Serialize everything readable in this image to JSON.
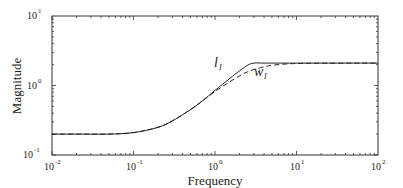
{
  "chart_data": {
    "type": "line",
    "title": "",
    "xlabel": "Frequency",
    "ylabel": "Magnitude",
    "xscale": "log",
    "yscale": "log",
    "xlim": [
      0.01,
      100
    ],
    "ylim": [
      0.1,
      10
    ],
    "grid": false,
    "legend": "none (inline annotations)",
    "x_ticks": [
      {
        "base": "10",
        "exp": "-2"
      },
      {
        "base": "10",
        "exp": "-1"
      },
      {
        "base": "10",
        "exp": "0"
      },
      {
        "base": "10",
        "exp": "1"
      },
      {
        "base": "10",
        "exp": "2"
      }
    ],
    "y_ticks": [
      {
        "base": "10",
        "exp": "-1"
      },
      {
        "base": "10",
        "exp": "0"
      },
      {
        "base": "10",
        "exp": "1"
      }
    ],
    "x": [
      0.01,
      0.02,
      0.05,
      0.1,
      0.2,
      0.3,
      0.5,
      0.7,
      1.0,
      1.5,
      2.0,
      2.5,
      3.0,
      4.0,
      5.0,
      7.0,
      10,
      20,
      50,
      100
    ],
    "series": [
      {
        "name": "l_I",
        "style": "solid",
        "values": [
          0.2,
          0.2,
          0.2,
          0.21,
          0.25,
          0.31,
          0.45,
          0.6,
          0.85,
          1.25,
          1.62,
          1.95,
          2.1,
          2.1,
          2.1,
          2.1,
          2.1,
          2.1,
          2.1,
          2.1
        ]
      },
      {
        "name": "w_I",
        "style": "dashed",
        "values": [
          0.2,
          0.2,
          0.2,
          0.21,
          0.25,
          0.31,
          0.45,
          0.6,
          0.82,
          1.12,
          1.38,
          1.57,
          1.7,
          1.86,
          1.95,
          2.03,
          2.07,
          2.09,
          2.1,
          2.1
        ]
      }
    ],
    "annotations": [
      {
        "text": "l",
        "subscript": "I",
        "series": "l_I"
      },
      {
        "text": "w",
        "subscript": "I",
        "series": "w_I"
      }
    ]
  },
  "labels": {
    "xlabel": "Frequency",
    "ylabel": "Magnitude",
    "l_main": "l",
    "l_sub": "I",
    "w_main": "w",
    "w_sub": "I",
    "tick_base": "10"
  }
}
